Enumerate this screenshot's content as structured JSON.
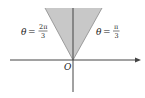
{
  "diagram": {
    "title": "",
    "region": {
      "description": "Shaded sector between rays theta = pi/3 and theta = 2pi/3",
      "fill_color": "#c8c8c8",
      "edge_color": "#888888"
    },
    "axes": {
      "color": "#444444",
      "origin_label": "O"
    },
    "labels": {
      "left": {
        "theta": "θ",
        "equals": "=",
        "numerator": "2π",
        "denominator": "3"
      },
      "right": {
        "theta": "θ",
        "equals": "=",
        "numerator": "π",
        "denominator": "3"
      }
    }
  }
}
